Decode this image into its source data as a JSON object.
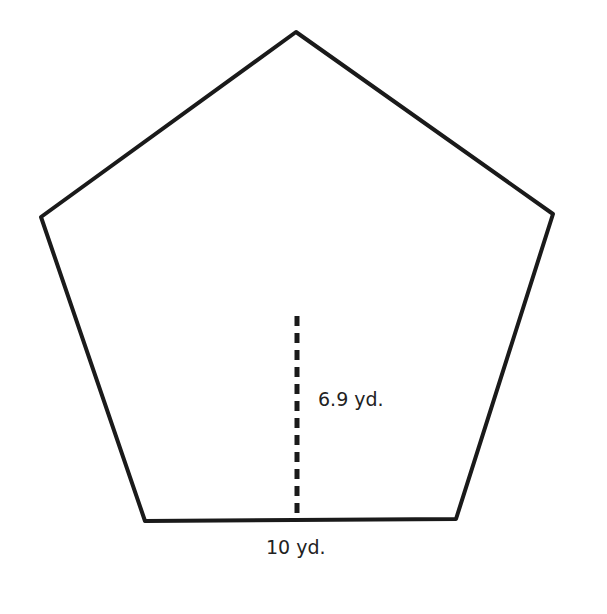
{
  "figure": {
    "shape": "regular pentagon",
    "apothem_label": "6.9 yd.",
    "side_label": "10 yd.",
    "colors": {
      "stroke": "#1a1a1a",
      "text": "#222222",
      "background": "#ffffff"
    }
  }
}
